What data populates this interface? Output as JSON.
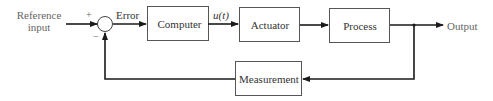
{
  "diagram": {
    "type": "feedback-control-block-diagram",
    "input_label_line1": "Reference",
    "input_label_line2": "input",
    "plus_sign": "+",
    "minus_sign": "−",
    "error_label": "Error",
    "control_signal_label": "u(t)",
    "output_label": "Output",
    "blocks": [
      {
        "id": "computer",
        "label": "Computer"
      },
      {
        "id": "actuator",
        "label": "Actuator"
      },
      {
        "id": "process",
        "label": "Process"
      },
      {
        "id": "measurement",
        "label": "Measurement"
      }
    ],
    "edges": [
      {
        "from": "reference-input",
        "to": "summing-junction",
        "sign": "+"
      },
      {
        "from": "summing-junction",
        "to": "computer",
        "label": "Error"
      },
      {
        "from": "computer",
        "to": "actuator",
        "label": "u(t)"
      },
      {
        "from": "actuator",
        "to": "process"
      },
      {
        "from": "process",
        "to": "output"
      },
      {
        "from": "process",
        "to": "measurement"
      },
      {
        "from": "measurement",
        "to": "summing-junction",
        "sign": "−"
      }
    ],
    "colors": {
      "line": "#1a1a1a",
      "text": "#333333",
      "background": "#ffffff"
    }
  }
}
